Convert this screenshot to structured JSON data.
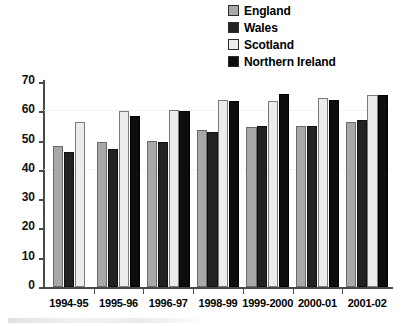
{
  "legend": {
    "position": "top-right",
    "items": [
      {
        "label": "England",
        "swatch": "legend-swatch-england",
        "color": "#a8a8a8"
      },
      {
        "label": "Wales",
        "swatch": "legend-swatch-wales",
        "color": "#222222"
      },
      {
        "label": "Scotland",
        "swatch": "legend-swatch-scotland",
        "color": "#ececec"
      },
      {
        "label": "Northern Ireland",
        "swatch": "legend-swatch-ni",
        "color": "#0d0d0d"
      }
    ]
  },
  "axis": {
    "y_ticks": [
      "70",
      "60",
      "50",
      "40",
      "30",
      "20",
      "10",
      "0"
    ],
    "x_ticks": [
      "1994-95",
      "1995-96",
      "1996-97",
      "1998-99",
      "1999-2000",
      "2000-01",
      "2001-02"
    ]
  },
  "chart_data": {
    "type": "bar",
    "title": "",
    "xlabel": "",
    "ylabel": "",
    "ylim": [
      0,
      70
    ],
    "ytick_step": 10,
    "grid": true,
    "legend_position": "top-right",
    "categories": [
      "1994-95",
      "1995-96",
      "1996-97",
      "1998-99",
      "1999-2000",
      "2000-01",
      "2001-02"
    ],
    "series": [
      {
        "name": "England",
        "color": "#a8a8a8",
        "values": [
          48,
          49.5,
          50,
          53.5,
          54.5,
          55,
          56.5
        ]
      },
      {
        "name": "Wales",
        "color": "#222222",
        "values": [
          46,
          47,
          49.5,
          53,
          55,
          55,
          57
        ]
      },
      {
        "name": "Scotland",
        "color": "#ececec",
        "values": [
          56.5,
          60,
          60.5,
          64,
          63.5,
          64.5,
          65.5
        ]
      },
      {
        "name": "Northern Ireland",
        "color": "#0d0d0d",
        "values": [
          null,
          58.5,
          60,
          63.5,
          66,
          64,
          65.5
        ]
      }
    ]
  }
}
